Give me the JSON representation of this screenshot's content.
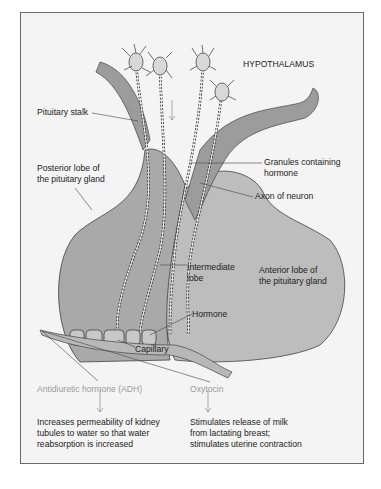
{
  "diagram": {
    "title_label": "HYPOTHALAMUS",
    "labels": {
      "pituitary_stalk": "Pituitary stalk",
      "posterior_lobe": "Posterior lobe of\nthe pituitary gland",
      "granules": "Granules containing\nhormone",
      "axon": "Axon of neuron",
      "intermediate_lobe": "Intermediate\nlobe",
      "anterior_lobe": "Anterior lobe of\nthe pituitary gland",
      "hormone": "Hormone",
      "capillary": "Capillary"
    },
    "outputs": [
      {
        "hormone": "Antidiuretic hormone (ADH)",
        "effect": "Increases permeability of kidney\ntubules to water so that water\nreabsorption is increased"
      },
      {
        "hormone": "Oxytocin",
        "effect": "Stimulates release of milk\nfrom lactating breast;\nstimulates uterine contraction"
      }
    ],
    "colors": {
      "gland_fill": "#a9a9a9",
      "anterior_fill": "#bdbdbd",
      "stalk_fill": "#9c9c9c",
      "background": "#f4f4f4",
      "line": "#333333"
    }
  }
}
